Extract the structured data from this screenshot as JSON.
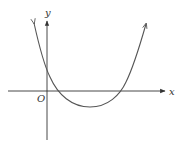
{
  "figure": {
    "type": "function-graph",
    "labels": {
      "x_axis": "x",
      "y_axis": "y",
      "origin": "O"
    },
    "colors": {
      "axis": "#333333",
      "curve": "#555555",
      "background": "#ffffff"
    },
    "curve": {
      "shape": "parabola",
      "opens": "up",
      "y_intercept": "positive",
      "roots": "two positive",
      "vertex": "below x-axis, right of y-axis",
      "arrows_on_ends": true
    }
  }
}
